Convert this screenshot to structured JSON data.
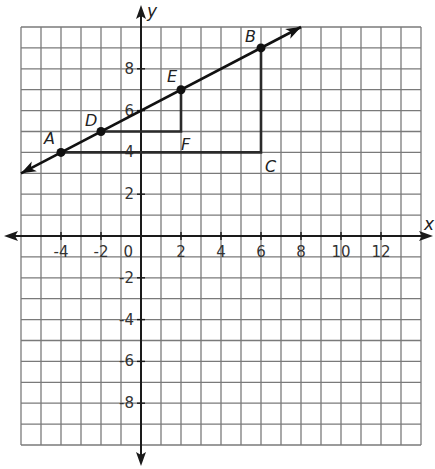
{
  "chart_data": {
    "type": "scatter",
    "title": "",
    "xlabel": "x",
    "ylabel": "y",
    "xlim": [
      -6,
      14
    ],
    "ylim": [
      -10,
      10
    ],
    "grid": true,
    "grid_step": 1,
    "x_ticks": [
      {
        "value": -4,
        "label": "-4"
      },
      {
        "value": -2,
        "label": "-2"
      },
      {
        "value": 2,
        "label": "2"
      },
      {
        "value": 4,
        "label": "4"
      },
      {
        "value": 6,
        "label": "6"
      },
      {
        "value": 8,
        "label": "8"
      },
      {
        "value": 10,
        "label": "10"
      },
      {
        "value": 12,
        "label": "12"
      }
    ],
    "y_ticks": [
      {
        "value": 8,
        "label": "8"
      },
      {
        "value": 6,
        "label": "6"
      },
      {
        "value": 4,
        "label": "4"
      },
      {
        "value": 2,
        "label": "2"
      },
      {
        "value": -2,
        "label": "-2"
      },
      {
        "value": -4,
        "label": "-4"
      },
      {
        "value": -6,
        "label": "-6"
      },
      {
        "value": -8,
        "label": "-8"
      }
    ],
    "origin_label": "0",
    "points": [
      {
        "name": "A",
        "x": -4,
        "y": 4,
        "dot": true
      },
      {
        "name": "D",
        "x": -2,
        "y": 5,
        "dot": true
      },
      {
        "name": "E",
        "x": 2,
        "y": 7,
        "dot": true
      },
      {
        "name": "B",
        "x": 6,
        "y": 9,
        "dot": true
      },
      {
        "name": "F",
        "x": 2,
        "y": 5,
        "dot": false
      },
      {
        "name": "C",
        "x": 6,
        "y": 4,
        "dot": false
      }
    ],
    "line": {
      "slope": 0.5,
      "intercept": 6,
      "from": [
        -6,
        3
      ],
      "to": [
        8,
        10
      ],
      "arrows": "both"
    },
    "triangles": [
      {
        "name": "triangle DEF",
        "vertices": [
          "D",
          "E",
          "F"
        ],
        "right_angle_at": "F"
      },
      {
        "name": "triangle ABC",
        "vertices": [
          "A",
          "B",
          "C"
        ],
        "right_angle_at": "C"
      }
    ]
  }
}
